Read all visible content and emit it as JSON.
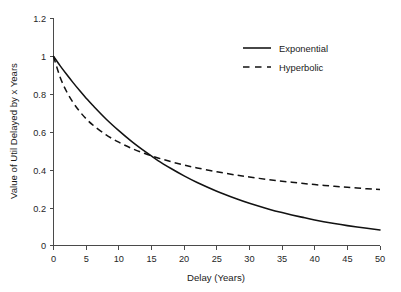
{
  "chart_data": {
    "type": "line",
    "title": "",
    "subtitle": "",
    "xlabel": "Delay (Years)",
    "ylabel": "Value of Util Delayed by x Years",
    "xlim": [
      0,
      50
    ],
    "ylim": [
      0,
      1.2
    ],
    "xticks": [
      0,
      5,
      10,
      15,
      20,
      25,
      30,
      35,
      40,
      45,
      50
    ],
    "xtick_labels": [
      "0",
      "5",
      "10",
      "15",
      "20",
      "25",
      "30",
      "35",
      "40",
      "45",
      "50"
    ],
    "yticks": [
      0,
      0.2,
      0.4,
      0.6,
      0.8,
      1,
      1.2
    ],
    "ytick_labels": [
      "0",
      "0.2",
      "0.4",
      "0.6",
      "0.8",
      "1",
      "1.2"
    ],
    "grid": false,
    "legend_position": "upper right inside",
    "background_color": "#ffffff",
    "line_color": "#121212",
    "x": [
      0,
      1,
      2,
      3,
      4,
      5,
      6,
      8,
      10,
      12,
      14,
      16,
      18,
      20,
      22,
      25,
      28,
      30,
      33,
      35,
      38,
      40,
      43,
      45,
      48,
      50
    ],
    "series": [
      {
        "name": "Exponential",
        "style": "solid",
        "equation": "V = e^(-0.05 t)",
        "values": [
          1.0,
          0.951,
          0.905,
          0.861,
          0.819,
          0.779,
          0.741,
          0.67,
          0.607,
          0.549,
          0.497,
          0.449,
          0.407,
          0.368,
          0.333,
          0.287,
          0.247,
          0.223,
          0.192,
          0.174,
          0.15,
          0.135,
          0.116,
          0.105,
          0.091,
          0.082
        ]
      },
      {
        "name": "Hyperbolic",
        "style": "dashed",
        "equation": "V = 1 / (1 + 0.2 t)^0.65",
        "values": [
          1.0,
          0.891,
          0.814,
          0.756,
          0.709,
          0.67,
          0.638,
          0.586,
          0.546,
          0.513,
          0.486,
          0.463,
          0.443,
          0.425,
          0.41,
          0.39,
          0.372,
          0.362,
          0.348,
          0.34,
          0.329,
          0.322,
          0.313,
          0.308,
          0.3,
          0.296
        ]
      }
    ],
    "legend": [
      {
        "label": "Exponential",
        "style": "solid"
      },
      {
        "label": "Hyperbolic",
        "style": "dashed"
      }
    ],
    "annotations": [
      {
        "text": "",
        "note": "curves cross near 17 years at value 0.33"
      }
    ]
  }
}
